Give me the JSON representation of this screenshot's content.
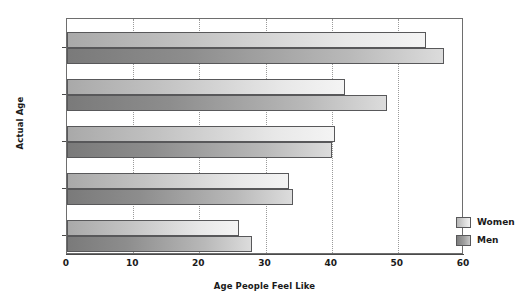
{
  "chart_data": {
    "type": "bar",
    "orientation": "horizontal",
    "title": "",
    "xlabel": "Age People Feel Like",
    "ylabel": "Actual Age",
    "categories": [
      "25–34",
      "35–44",
      "45–54",
      "55–64",
      "65–74"
    ],
    "series": [
      {
        "name": "Women",
        "values": [
          26,
          33.5,
          40.5,
          42,
          54.3
        ]
      },
      {
        "name": "Men",
        "values": [
          28,
          34.2,
          40,
          48.3,
          57
        ]
      }
    ],
    "xlim": [
      0,
      60
    ],
    "xticks": [
      0,
      10,
      20,
      30,
      40,
      50,
      60
    ],
    "xtick_labels": [
      "0",
      "10",
      "20",
      "30",
      "40",
      "50",
      "60"
    ],
    "grid": "vertical-dotted",
    "legend_position": "inside-right",
    "legend_entries": [
      "Women",
      "Men"
    ],
    "colors": {
      "women": "#d8d8d8",
      "men": "#8f8f8f",
      "bar_border": "#58585a",
      "axis": "#4a4a4a",
      "grid": "#9a9a9a",
      "text": "#1a1a1a",
      "background": "#ffffff"
    }
  }
}
